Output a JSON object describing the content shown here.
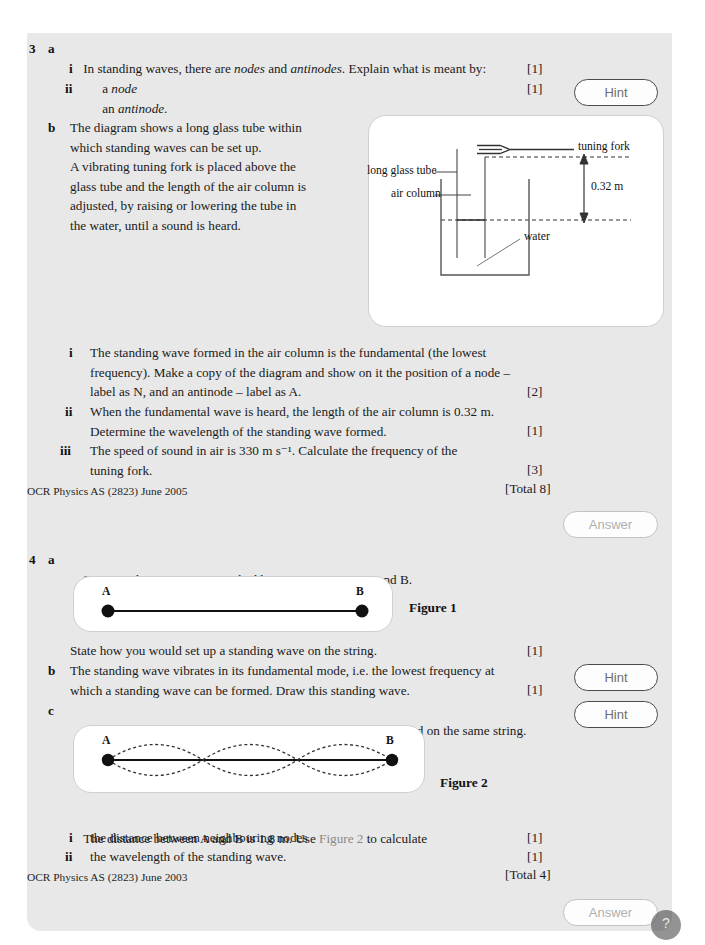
{
  "page": {
    "background_color": "#e8e8e8",
    "page_color": "#ffffff"
  },
  "questions": [
    {
      "number": "3",
      "parts": [
        {
          "letter": "a",
          "stem_pre": "In standing waves, there are ",
          "stem_it1": "nodes",
          "stem_mid": " and ",
          "stem_it2": "antinodes",
          "stem_post": ". Explain what is meant by:",
          "subparts": [
            {
              "roman": "i",
              "pre": "a ",
              "italic": "node",
              "post": "",
              "marks": "[1]"
            },
            {
              "roman": "ii",
              "pre": "an ",
              "italic": "antinode",
              "post": ".",
              "marks": "[1]"
            }
          ]
        },
        {
          "letter": "b",
          "body": "The diagram shows a long glass tube within\nwhich standing waves can be set up.\nA vibrating tuning fork is placed above the\nglass tube and the length of the air column is\nadjusted, by raising or lowering the tube in\nthe water, until a sound is heard.",
          "subparts": [
            {
              "roman": "i",
              "text": "The standing wave formed in the air column is the fundamental (the lowest\nfrequency). Make a copy of the diagram and show on it the position of a node –\nlabel as N, and an antinode – label as A.",
              "marks": "[2]"
            },
            {
              "roman": "ii",
              "text": "When the fundamental wave is heard, the length of the air column is 0.32 m.\nDetermine the wavelength of the standing wave formed.",
              "marks": "[1]"
            },
            {
              "roman": "iii",
              "text": "The speed of sound in air is 330 m s⁻¹. Calculate the frequency of the\ntuning fork.",
              "marks": "[3]"
            }
          ]
        }
      ],
      "source": "OCR Physics AS (2823) June 2005",
      "total": "[Total 8]"
    },
    {
      "number": "4",
      "parts": [
        {
          "letter": "a",
          "ref": "Figure 1",
          "stem_post": " shows a string stretched between two points A and B.",
          "after_figure_text": "State how you would set up a standing wave on the string.",
          "after_figure_marks": "[1]"
        },
        {
          "letter": "b",
          "text": "The standing wave vibrates in its fundamental mode, i.e. the lowest frequency at\nwhich a standing wave can be formed. Draw this standing wave.",
          "marks": "[1]"
        },
        {
          "letter": "c",
          "ref": "Figure 2",
          "stem_post": " shows the appearance of another standing wave formed on the same string.",
          "lead_pre": "The distance between A and B is 1.8 m. Use ",
          "lead_ref": "Figure 2",
          "lead_post": " to calculate",
          "subparts": [
            {
              "roman": "i",
              "text": "the distance between neighbouring nodes",
              "marks": "[1]"
            },
            {
              "roman": "ii",
              "text": "the wavelength of the standing wave.",
              "marks": "[1]"
            }
          ]
        }
      ],
      "source": "OCR Physics AS (2823) June 2003",
      "total": "[Total 4]"
    }
  ],
  "buttons": {
    "hint_label": "Hint",
    "answer_label": "Answer",
    "hints": [
      "Hint",
      "Hint",
      "Hint"
    ],
    "answers": [
      "Answer",
      "Answer"
    ]
  },
  "figures": {
    "tube_diagram": {
      "labels": {
        "tuning_fork": "tuning fork",
        "long_glass_tube": "long glass tube",
        "air_column": "air column",
        "water": "water",
        "dimension": "0.32 m"
      }
    },
    "figure1": {
      "caption": "Figure 1",
      "point_a": "A",
      "point_b": "B"
    },
    "figure2": {
      "caption": "Figure 2",
      "point_a": "A",
      "point_b": "B",
      "loops": 3
    }
  },
  "corner_badge": "?"
}
